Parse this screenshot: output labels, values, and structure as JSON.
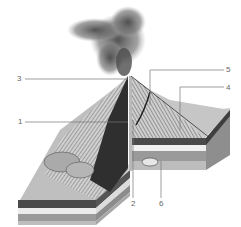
{
  "diagram": {
    "labels": [
      {
        "id": "1",
        "text": "1"
      },
      {
        "id": "2",
        "text": "2"
      },
      {
        "id": "3",
        "text": "3"
      },
      {
        "id": "4",
        "text": "4"
      },
      {
        "id": "5",
        "text": "5"
      },
      {
        "id": "6",
        "text": "6"
      }
    ],
    "colors": {
      "smoke": "#6e6e6e",
      "slope_light": "#c9c9c9",
      "slope_dark": "#3a3a3a",
      "strata_dark": "#4a4a4a",
      "strata_light": "#ececec",
      "strata_mid": "#9a9a9a",
      "strata_base": "#bdbdbd",
      "leader": "#777777"
    }
  }
}
